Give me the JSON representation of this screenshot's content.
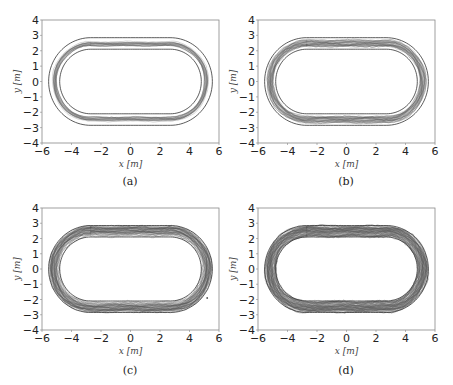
{
  "figure": {
    "captions": [
      "(a)",
      "(b)",
      "(c)",
      "(d)"
    ]
  },
  "chart_data": [
    {
      "type": "line",
      "panel": "(a)",
      "title": "",
      "xlabel": "x [m]",
      "ylabel": "y [m]",
      "xlim": [
        -6,
        6
      ],
      "ylim": [
        -4,
        4
      ],
      "xticks": [
        -6,
        -4,
        -2,
        0,
        2,
        4,
        6
      ],
      "yticks": [
        -4,
        -3,
        -2,
        -1,
        0,
        1,
        2,
        3,
        4
      ],
      "grid": false,
      "track": {
        "shape": "stadium",
        "straight_half_length": 2.7,
        "outer_radius": 2.85,
        "inner_radius": 2.1
      },
      "trajectories": {
        "count": "many",
        "spread": "narrow",
        "band_radius_range": [
          2.3,
          2.6
        ],
        "description": "Tightly clustered trajectories close to the middle of the lane"
      }
    },
    {
      "type": "line",
      "panel": "(b)",
      "title": "",
      "xlabel": "x [m]",
      "ylabel": "y [m]",
      "xlim": [
        -6,
        6
      ],
      "ylim": [
        -4,
        4
      ],
      "xticks": [
        -6,
        -4,
        -2,
        0,
        2,
        4,
        6
      ],
      "yticks": [
        -4,
        -3,
        -2,
        -1,
        0,
        1,
        2,
        3,
        4
      ],
      "grid": false,
      "track": {
        "shape": "stadium",
        "straight_half_length": 2.7,
        "outer_radius": 2.85,
        "inner_radius": 2.1
      },
      "trajectories": {
        "count": "many",
        "spread": "medium",
        "band_radius_range": [
          2.2,
          2.7
        ],
        "description": "Trajectories spread somewhat more across the lane"
      }
    },
    {
      "type": "line",
      "panel": "(c)",
      "title": "",
      "xlabel": "x [m]",
      "ylabel": "y [m]",
      "xlim": [
        -6,
        6
      ],
      "ylim": [
        -4,
        4
      ],
      "xticks": [
        -6,
        -4,
        -2,
        0,
        2,
        4,
        6
      ],
      "yticks": [
        -4,
        -3,
        -2,
        -1,
        0,
        1,
        2,
        3,
        4
      ],
      "grid": false,
      "track": {
        "shape": "stadium",
        "straight_half_length": 2.7,
        "outer_radius": 2.85,
        "inner_radius": 2.1
      },
      "trajectories": {
        "count": "many",
        "spread": "wide",
        "band_radius_range": [
          2.15,
          2.8
        ],
        "description": "Dense trajectories filling most of the lane, with one outlier point near (5.2, -1.9)"
      },
      "outliers": [
        {
          "x": 5.2,
          "y": -1.9
        }
      ]
    },
    {
      "type": "line",
      "panel": "(d)",
      "title": "",
      "xlabel": "x [m]",
      "ylabel": "y [m]",
      "xlim": [
        -6,
        6
      ],
      "ylim": [
        -4,
        4
      ],
      "xticks": [
        -6,
        -4,
        -2,
        0,
        2,
        4,
        6
      ],
      "yticks": [
        -4,
        -3,
        -2,
        -1,
        0,
        1,
        2,
        3,
        4
      ],
      "grid": false,
      "track": {
        "shape": "stadium",
        "straight_half_length": 2.7,
        "outer_radius": 2.85,
        "inner_radius": 2.1
      },
      "trajectories": {
        "count": "many",
        "spread": "widest",
        "band_radius_range": [
          2.12,
          2.83
        ],
        "description": "Very dense trajectories covering nearly the full lane width"
      }
    }
  ],
  "colors": {
    "axes": "#888888",
    "track_boundary": "#333333",
    "trajectory": "#555555",
    "tick_text": "#222222",
    "label_text": "#444444"
  }
}
